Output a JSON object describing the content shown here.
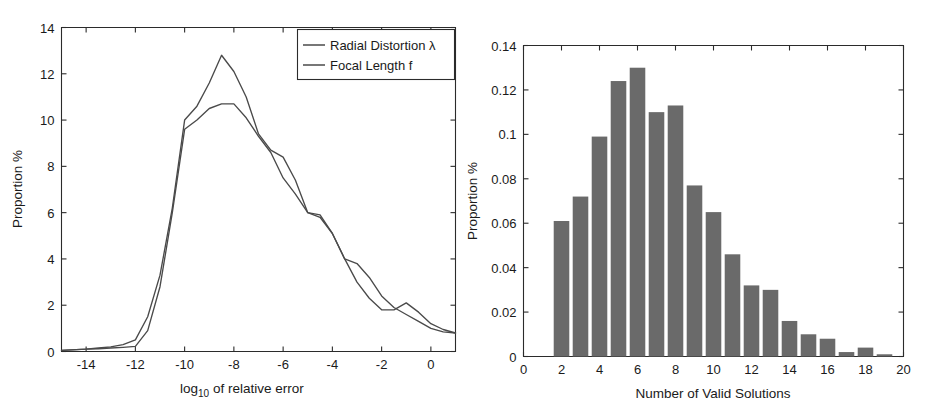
{
  "figure": {
    "background_color": "#ffffff",
    "axis_color": "#2b2b2b",
    "line_color": "#4a4a4a",
    "bar_color": "#6a6a6a"
  },
  "chart_data": [
    {
      "id": "left",
      "type": "line",
      "title": "",
      "xlabel": "log10 of relative error",
      "xlabel_base": "log",
      "xlabel_sub": "10",
      "xlabel_rest": " of relative error",
      "ylabel": "Proportion %",
      "xlim": [
        -15,
        1
      ],
      "ylim": [
        0,
        14
      ],
      "xticks": [
        -14,
        -12,
        -10,
        -8,
        -6,
        -4,
        -2,
        0
      ],
      "xticklabels": [
        "-14",
        "-12",
        "-10",
        "-8",
        "-6",
        "-4",
        "-2",
        "0"
      ],
      "yticks": [
        0,
        2,
        4,
        6,
        8,
        10,
        12,
        14
      ],
      "yticklabels": [
        "0",
        "2",
        "4",
        "6",
        "8",
        "10",
        "12",
        "14"
      ],
      "grid": false,
      "legend_position": "top-right",
      "x": [
        -15,
        -14,
        -13.5,
        -13,
        -12.5,
        -12,
        -11.5,
        -11,
        -10.5,
        -10,
        -9.5,
        -9,
        -8.5,
        -8,
        -7.5,
        -7,
        -6.5,
        -6,
        -5.5,
        -5,
        -4.5,
        -4,
        -3.5,
        -3,
        -2.5,
        -2,
        -1.5,
        -1,
        -0.5,
        0,
        0.5,
        1
      ],
      "series": [
        {
          "name": "Radial Distortion λ",
          "values": [
            0.05,
            0.1,
            0.15,
            0.2,
            0.3,
            0.5,
            1.5,
            3.3,
            6.2,
            10.0,
            10.6,
            11.6,
            12.8,
            12.1,
            11.0,
            9.4,
            8.7,
            8.4,
            7.4,
            6.0,
            5.9,
            5.1,
            4.0,
            3.8,
            3.2,
            2.4,
            1.9,
            1.6,
            1.3,
            1.0,
            0.85,
            0.8
          ]
        },
        {
          "name": "Focal Length f",
          "values": [
            0.05,
            0.1,
            0.12,
            0.15,
            0.18,
            0.22,
            0.9,
            2.8,
            6.0,
            9.6,
            10.0,
            10.5,
            10.7,
            10.7,
            10.1,
            9.3,
            8.6,
            7.5,
            6.8,
            6.0,
            5.8,
            5.1,
            4.0,
            3.0,
            2.3,
            1.8,
            1.8,
            2.1,
            1.7,
            1.2,
            0.95,
            0.8
          ]
        }
      ],
      "legend": [
        {
          "label": "Radial Distortion λ"
        },
        {
          "label": "Focal Length f"
        }
      ]
    },
    {
      "id": "right",
      "type": "bar",
      "title": "",
      "xlabel": "Number of Valid Solutions",
      "ylabel": "Proportion %",
      "xlim": [
        0,
        20
      ],
      "ylim": [
        0,
        0.14
      ],
      "xticks": [
        0,
        2,
        4,
        6,
        8,
        10,
        12,
        14,
        16,
        18,
        20
      ],
      "xticklabels": [
        "0",
        "2",
        "4",
        "6",
        "8",
        "10",
        "12",
        "14",
        "16",
        "18",
        "20"
      ],
      "yticks": [
        0,
        0.02,
        0.04,
        0.06,
        0.08,
        0.1,
        0.12,
        0.14
      ],
      "yticklabels": [
        "0",
        "0.02",
        "0.04",
        "0.06",
        "0.08",
        "0.1",
        "0.12",
        "0.14"
      ],
      "grid": false,
      "categories": [
        2,
        3,
        4,
        5,
        6,
        7,
        8,
        9,
        10,
        11,
        12,
        13,
        14,
        15,
        16,
        17,
        18,
        19
      ],
      "values": [
        0.061,
        0.072,
        0.099,
        0.124,
        0.13,
        0.11,
        0.113,
        0.077,
        0.065,
        0.046,
        0.032,
        0.03,
        0.016,
        0.01,
        0.008,
        0.002,
        0.004,
        0.001
      ]
    }
  ]
}
